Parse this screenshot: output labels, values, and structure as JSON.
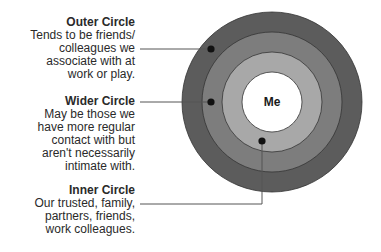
{
  "diagram": {
    "center_label": "Me",
    "circles": [
      {
        "id": "outer",
        "title": "Outer Circle",
        "description": "Tends to be friends/\ncolleagues we\nassociate with at\nwork or play.",
        "color": "#5c5c5c"
      },
      {
        "id": "wider",
        "title": "Wider Circle",
        "description": "May be those we\nhave more regular\ncontact with but\naren't necessarily\nintimate with.",
        "color": "#7d7d7d"
      },
      {
        "id": "inner",
        "title": "Inner Circle",
        "description": "Our trusted, family,\npartners, friends,\nwork colleagues.",
        "color": "#a8a8a8"
      }
    ],
    "center_color": "#ffffff"
  }
}
